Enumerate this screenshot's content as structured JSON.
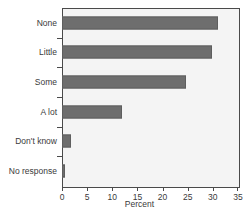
{
  "chart_data": {
    "type": "bar",
    "orientation": "horizontal",
    "title": "",
    "xlabel": "Percent",
    "ylabel": "",
    "categories": [
      "None",
      "Little",
      "Some",
      "A lot",
      "Don't know",
      "No response"
    ],
    "values": [
      31.0,
      29.8,
      24.7,
      12.0,
      1.7,
      0.5
    ],
    "xlim": [
      0,
      35
    ],
    "xticks": [
      0,
      5,
      10,
      15,
      20,
      25,
      30,
      35
    ],
    "xticklabels": [
      "0",
      "5",
      "10",
      "15",
      "20",
      "25",
      "30",
      "35"
    ],
    "grid": false,
    "legend": null,
    "colors": {
      "bar_fill": "#6e6e6e",
      "bar_edge": "#5e5e5e",
      "plot_background": "#f4f4f4",
      "frame": "#4a4a4a",
      "text": "#3a3a3a",
      "figure_background": "#ffffff"
    }
  }
}
